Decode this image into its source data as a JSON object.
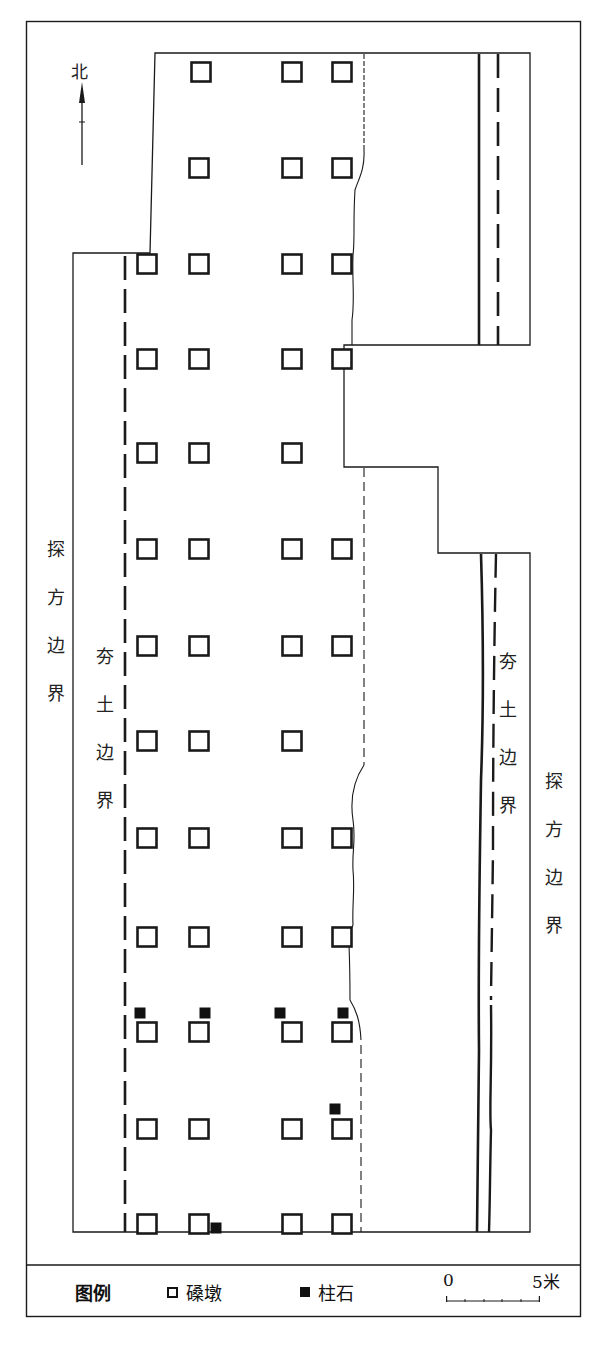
{
  "figure": {
    "north_label": "北",
    "left_excavation_label": [
      "探",
      "方",
      "边",
      "界"
    ],
    "left_rammed_label": [
      "夯",
      "土",
      "边",
      "界"
    ],
    "right_rammed_label": [
      "夯",
      "土",
      "边",
      "界"
    ],
    "right_excavation_label": [
      "探",
      "方",
      "边",
      "界"
    ]
  },
  "legend": {
    "title": "图例",
    "items": [
      {
        "symbol": "open-square",
        "label": "磉墩"
      },
      {
        "symbol": "filled-square",
        "label": "柱石"
      }
    ],
    "scale": {
      "start": "0",
      "end": "5米",
      "ticks": 5
    }
  },
  "grid": {
    "columns_x": [
      147,
      199,
      292,
      342
    ],
    "rows": [
      {
        "y": 72,
        "present": [
          false,
          true,
          true,
          true
        ],
        "col1_x": 201
      },
      {
        "y": 168,
        "present": [
          false,
          true,
          true,
          true
        ]
      },
      {
        "y": 264,
        "present": [
          true,
          true,
          true,
          true
        ]
      },
      {
        "y": 359,
        "present": [
          true,
          true,
          true,
          true
        ]
      },
      {
        "y": 453,
        "present": [
          true,
          true,
          true,
          false
        ]
      },
      {
        "y": 549,
        "present": [
          true,
          true,
          true,
          true
        ]
      },
      {
        "y": 646,
        "present": [
          true,
          true,
          true,
          true
        ]
      },
      {
        "y": 741,
        "present": [
          true,
          true,
          true,
          false
        ]
      },
      {
        "y": 838,
        "present": [
          true,
          true,
          true,
          true
        ]
      },
      {
        "y": 937,
        "present": [
          true,
          true,
          true,
          true
        ]
      },
      {
        "y": 1032,
        "present": [
          true,
          true,
          true,
          true
        ]
      },
      {
        "y": 1129,
        "present": [
          true,
          true,
          true,
          true
        ]
      },
      {
        "y": 1224,
        "present": [
          true,
          true,
          true,
          true
        ]
      }
    ],
    "pillar_stones": [
      {
        "x": 140,
        "y": 1013
      },
      {
        "x": 205,
        "y": 1013
      },
      {
        "x": 280,
        "y": 1013
      },
      {
        "x": 343,
        "y": 1013
      },
      {
        "x": 335,
        "y": 1109
      },
      {
        "x": 216,
        "y": 1228
      }
    ]
  },
  "colors": {
    "line": "#1a1a1a",
    "background": "#ffffff"
  }
}
